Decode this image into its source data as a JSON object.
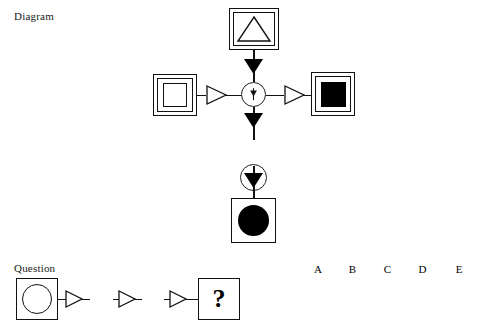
{
  "page": {
    "width": 494,
    "height": 329,
    "background": "#ffffff",
    "ink_color": "#000000"
  },
  "diagram_section": {
    "label": "Diagram",
    "nodes": {
      "top": {
        "name": "open-triangle-in-double-square",
        "frame": "double-square",
        "shape": "triangle-open",
        "fill": "white"
      },
      "left": {
        "name": "open-square-in-double-square",
        "frame": "double-square",
        "shape": "square-open",
        "fill": "white"
      },
      "right": {
        "name": "filled-square-in-double-square",
        "frame": "double-square",
        "shape": "square-filled",
        "fill": "black"
      },
      "bottom": {
        "name": "filled-circle-in-single-square",
        "frame": "single-square",
        "shape": "circle-filled",
        "fill": "black"
      }
    },
    "operators": {
      "center": {
        "name": "operator-arrowhead",
        "glyph": "small-down-arrowhead",
        "container": "circle"
      },
      "lower": {
        "name": "operator-double-slash",
        "glyph": "two-parallel-slashes",
        "container": "circle"
      }
    },
    "connectors": {
      "vertical_arrow": "solid-filled-down-triangle",
      "horizontal_arrow": "hollow-right-triangle"
    }
  },
  "question_section": {
    "label": "Question",
    "sequence": [
      {
        "type": "box",
        "name": "open-circle-in-square",
        "shape": "circle-open"
      },
      {
        "type": "arrow",
        "name": "hollow-right-arrow"
      },
      {
        "type": "operator",
        "name": "operator-double-slash",
        "glyph": "two-parallel-slashes"
      },
      {
        "type": "arrow",
        "name": "hollow-right-arrow"
      },
      {
        "type": "operator",
        "name": "operator-arrowhead",
        "glyph": "small-down-arrowhead"
      },
      {
        "type": "arrow",
        "name": "hollow-right-arrow"
      },
      {
        "type": "box",
        "name": "question-mark-box",
        "text": "?"
      }
    ],
    "question_mark": "?"
  },
  "answers": {
    "letters": [
      "A",
      "B",
      "C",
      "D",
      "E"
    ],
    "options": [
      {
        "letter": "A",
        "shape": "square-filled",
        "label": ""
      },
      {
        "letter": "B",
        "shape": "triangle-open",
        "label": ""
      },
      {
        "letter": "C",
        "shape": "circle-filled",
        "label": ""
      },
      {
        "letter": "D",
        "shape": "triangle-filled",
        "label": ""
      },
      {
        "letter": "E",
        "shape": "text",
        "label": "None of these",
        "lines": [
          "None",
          "of",
          "these"
        ]
      }
    ],
    "none_of_these": {
      "line1": "None",
      "line2": "of",
      "line3": "these"
    }
  }
}
